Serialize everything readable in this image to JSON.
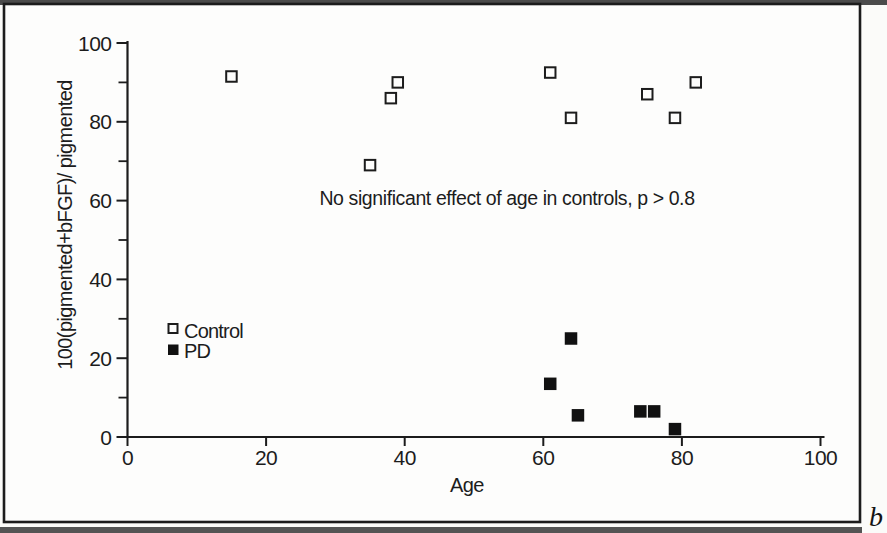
{
  "figure": {
    "panel_label": "b",
    "paper_color": "#fbfbf9",
    "ink_color": "#1c1c1c",
    "scan_band_color": "#3c3c3c"
  },
  "chart_data": {
    "type": "scatter",
    "title": "",
    "xlabel": "Age",
    "ylabel": "100(pigmented+bFGF)/ pigmented",
    "annotation": "No significant effect of age in controls, p > 0.8",
    "xlim": [
      0,
      100
    ],
    "ylim": [
      0,
      100
    ],
    "x_ticks": [
      0,
      20,
      40,
      60,
      80,
      100
    ],
    "y_ticks": [
      0,
      20,
      40,
      60,
      80,
      100
    ],
    "y_minor_ticks": [
      10,
      30,
      50,
      70,
      90
    ],
    "grid": false,
    "legend_position": "middle-left",
    "series": [
      {
        "name": "Control",
        "marker": "open-square",
        "color": "#1c1c1c",
        "points": [
          [
            15,
            91.5
          ],
          [
            35,
            69
          ],
          [
            38,
            86
          ],
          [
            39,
            90
          ],
          [
            61,
            92.5
          ],
          [
            64,
            81
          ],
          [
            75,
            87
          ],
          [
            79,
            81
          ],
          [
            82,
            90
          ]
        ]
      },
      {
        "name": "PD",
        "marker": "filled-square",
        "color": "#111111",
        "points": [
          [
            61,
            13.5
          ],
          [
            64,
            25
          ],
          [
            65,
            5.5
          ],
          [
            74,
            6.5
          ],
          [
            76,
            6.5
          ],
          [
            79,
            2
          ]
        ]
      }
    ]
  }
}
